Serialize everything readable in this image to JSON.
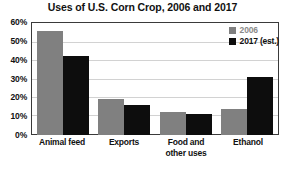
{
  "chart_data": {
    "type": "bar",
    "title": "Uses of U.S. Corn Crop, 2006 and 2017",
    "xlabel": "",
    "ylabel": "",
    "ylim": [
      0,
      60
    ],
    "ytick_labels": [
      "60%",
      "50%",
      "40%",
      "30%",
      "20%",
      "10%",
      "0%"
    ],
    "ytick_values": [
      60,
      50,
      40,
      30,
      20,
      10,
      0
    ],
    "grid": true,
    "legend_position": "top-right",
    "categories": [
      {
        "line1": "Animal feed",
        "line2": ""
      },
      {
        "line1": "Exports",
        "line2": ""
      },
      {
        "line1": "Food and",
        "line2": "other uses"
      },
      {
        "line1": "Ethanol",
        "line2": ""
      }
    ],
    "series": [
      {
        "name": "2006",
        "color": "#808080",
        "values": [
          55,
          19,
          12,
          14
        ]
      },
      {
        "name": "2017 (est.)",
        "color": "#0d0d0d",
        "values": [
          42,
          16,
          11,
          31
        ]
      }
    ]
  }
}
